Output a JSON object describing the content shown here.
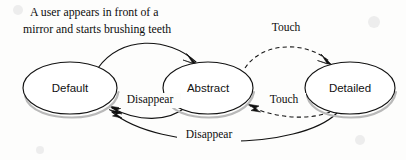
{
  "diagram": {
    "type": "state-transition-diagram",
    "caption": {
      "line1": "A user appears in front of a",
      "line2": "mirror and starts brushing teeth"
    },
    "states": [
      {
        "id": "default",
        "label": "Default",
        "cx": 70,
        "cy": 88,
        "rx": 47,
        "ry": 26
      },
      {
        "id": "abstract",
        "label": "Abstract",
        "cx": 208,
        "cy": 88,
        "rx": 45,
        "ry": 26
      },
      {
        "id": "detailed",
        "label": "Detailed",
        "cx": 350,
        "cy": 88,
        "rx": 45,
        "ry": 26
      }
    ],
    "transitions": [
      {
        "id": "default-to-abstract",
        "from": "Default",
        "to": "Abstract",
        "label": "",
        "style": "solid",
        "position": "upper"
      },
      {
        "id": "abstract-to-default",
        "from": "Abstract",
        "to": "Default",
        "label": "Disappear",
        "style": "solid",
        "position": "lower"
      },
      {
        "id": "abstract-to-detailed",
        "from": "Abstract",
        "to": "Detailed",
        "label": "Touch",
        "style": "dashed",
        "position": "upper"
      },
      {
        "id": "detailed-to-abstract",
        "from": "Detailed",
        "to": "Abstract",
        "label": "Touch",
        "style": "dashed",
        "position": "lower"
      },
      {
        "id": "detailed-to-default",
        "from": "Detailed",
        "to": "Default",
        "label": "Disappear",
        "style": "solid",
        "position": "bottom"
      }
    ],
    "labels": {
      "touch_top": "Touch",
      "touch_bottom": "Touch",
      "disappear_middle": "Disappear",
      "disappear_bottom": "Disappear"
    },
    "colors": {
      "background": "#fdfdfc",
      "stroke": "#121212",
      "node_fill": "#ffffff",
      "text": "#0d0d0d",
      "shadow": "#b9b9b9"
    }
  }
}
